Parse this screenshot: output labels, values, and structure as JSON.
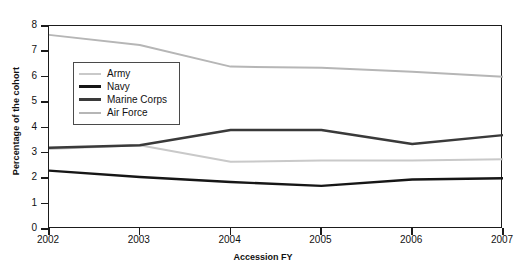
{
  "chart_data": {
    "type": "line",
    "title": "",
    "xlabel": "Accession FY",
    "ylabel": "Percentage of the cohort",
    "x": [
      2002,
      2003,
      2004,
      2005,
      2006,
      2007
    ],
    "xticklabels": [
      "2002",
      "2003",
      "2004",
      "2005",
      "2006",
      "2007"
    ],
    "yticklabels": [
      "0",
      "1",
      "2",
      "3",
      "4",
      "5",
      "6",
      "7",
      "8"
    ],
    "xlim": [
      2002,
      2007
    ],
    "ylim": [
      0,
      8
    ],
    "grid": false,
    "legend_position": "upper-left-inside",
    "series": [
      {
        "name": "Army",
        "color": "#c9c9c9",
        "width": 2.0,
        "values": [
          3.15,
          3.3,
          2.65,
          2.7,
          2.7,
          2.75
        ]
      },
      {
        "name": "Navy",
        "color": "#161616",
        "width": 2.4,
        "values": [
          2.3,
          2.05,
          1.85,
          1.7,
          1.95,
          2.0
        ]
      },
      {
        "name": "Marine Corps",
        "color": "#3a3a3a",
        "width": 2.4,
        "values": [
          3.2,
          3.3,
          3.9,
          3.9,
          3.35,
          3.7
        ]
      },
      {
        "name": "Air Force",
        "color": "#b6b6b6",
        "width": 2.0,
        "values": [
          7.65,
          7.25,
          6.4,
          6.35,
          6.2,
          6.0
        ]
      }
    ]
  },
  "axis": {
    "x_title": "Accession FY",
    "y_title": "Percentage of the cohort"
  }
}
